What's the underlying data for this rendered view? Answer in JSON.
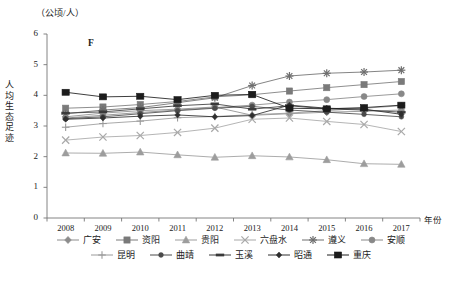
{
  "chart_data": {
    "type": "line",
    "title": "",
    "panel_label": "F",
    "unit_label": "（公顷/人）",
    "ylabel": "人均生态足迹",
    "xlabel": "年份",
    "ylim": [
      0,
      6
    ],
    "yticks": [
      "0",
      "1",
      "2",
      "3",
      "4",
      "5",
      "6"
    ],
    "grid": false,
    "legend_position": "bottom",
    "categories": [
      "2008",
      "2009",
      "2010",
      "2011",
      "2012",
      "2013",
      "2014",
      "2015",
      "2016",
      "2017"
    ],
    "series": [
      {
        "name": "广安",
        "marker": "diamond",
        "color": "#8c8c8c",
        "values": [
          3.3,
          3.42,
          3.5,
          3.55,
          3.62,
          3.35,
          3.4,
          3.45,
          3.48,
          3.52
        ]
      },
      {
        "name": "资阳",
        "marker": "square",
        "color": "#7a7a7a",
        "values": [
          3.58,
          3.62,
          3.7,
          3.8,
          3.95,
          4.02,
          4.14,
          4.25,
          4.35,
          4.45
        ]
      },
      {
        "name": "贵阳",
        "marker": "triangle",
        "color": "#9d9d9d",
        "values": [
          2.12,
          2.11,
          2.15,
          2.06,
          1.98,
          2.03,
          1.99,
          1.9,
          1.77,
          1.75
        ]
      },
      {
        "name": "六盘水",
        "marker": "cross",
        "color": "#a8a8a8",
        "values": [
          2.54,
          2.64,
          2.69,
          2.79,
          2.93,
          3.22,
          3.26,
          3.15,
          3.05,
          2.82
        ]
      },
      {
        "name": "遵义",
        "marker": "asterisk",
        "color": "#6e6e6e",
        "values": [
          3.4,
          3.52,
          3.6,
          3.76,
          3.92,
          4.32,
          4.63,
          4.72,
          4.76,
          4.82
        ]
      },
      {
        "name": "安顺",
        "marker": "circle",
        "color": "#888888",
        "values": [
          3.26,
          3.35,
          3.44,
          3.52,
          3.6,
          3.68,
          3.78,
          3.86,
          3.96,
          4.05
        ]
      },
      {
        "name": "昆明",
        "marker": "plus",
        "color": "#9a9a9a",
        "values": [
          2.96,
          3.08,
          3.16,
          3.27,
          3.31,
          3.37,
          3.42,
          3.5,
          3.58,
          3.66
        ]
      },
      {
        "name": "曲靖",
        "marker": "dot",
        "color": "#4a4a4a",
        "values": [
          3.24,
          3.3,
          3.4,
          3.5,
          3.58,
          3.64,
          3.52,
          3.45,
          3.38,
          3.3
        ]
      },
      {
        "name": "玉溪",
        "marker": "dash",
        "color": "#3a3a3a",
        "values": [
          3.42,
          3.46,
          3.56,
          3.66,
          3.72,
          3.55,
          3.66,
          3.56,
          3.52,
          3.45
        ]
      },
      {
        "name": "昭通",
        "marker": "smalldot",
        "color": "#2e2e2e",
        "values": [
          3.22,
          3.26,
          3.32,
          3.36,
          3.3,
          3.34,
          3.68,
          3.58,
          3.55,
          3.38
        ]
      },
      {
        "name": "重庆",
        "marker": "bigsquare",
        "color": "#1c1c1c",
        "values": [
          4.1,
          3.95,
          3.97,
          3.86,
          4.0,
          4.03,
          3.58,
          3.56,
          3.6,
          3.68
        ]
      }
    ]
  },
  "legend": {
    "row1": [
      "广安",
      "资阳",
      "贵阳",
      "六盘水",
      "遵义",
      "安顺"
    ],
    "row2": [
      "昆明",
      "曲靖",
      "玉溪",
      "昭通",
      "重庆"
    ]
  },
  "axis": {
    "x_axis_title": "年份",
    "y_unit": "（公顷/人）"
  }
}
